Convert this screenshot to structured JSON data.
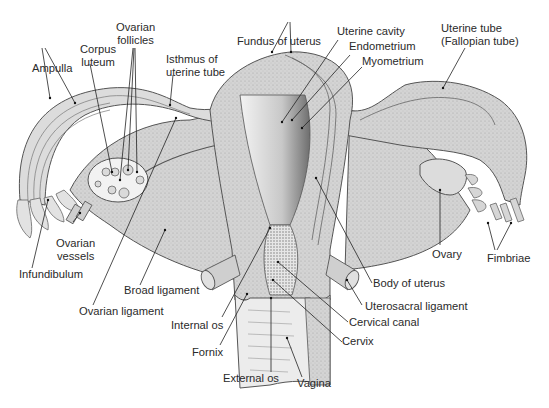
{
  "diagram": {
    "colors": {
      "background": "#ffffff",
      "tissue": "#d2d2d2",
      "tissue_dark": "#a8a8a8",
      "cavity": "#efefef",
      "outline": "#555555",
      "leader": "#222222",
      "text": "#2a2a2a"
    },
    "labels": {
      "ovarian_follicles_1": "Ovarian",
      "ovarian_follicles_2": "follicles",
      "corpus_luteum_1": "Corpus",
      "corpus_luteum_2": "luteum",
      "ampulla": "Ampulla",
      "isthmus_1": "Isthmus of",
      "isthmus_2": "uterine tube",
      "fundus": "Fundus of uterus",
      "uterine_cavity": "Uterine cavity",
      "endometrium": "Endometrium",
      "myometrium": "Myometrium",
      "uterine_tube_1": "Uterine tube",
      "uterine_tube_2": "(Fallopian tube)",
      "ovarian_vessels_1": "Ovarian",
      "ovarian_vessels_2": "vessels",
      "infundibulum": "Infundibulum",
      "broad_ligament": "Broad ligament",
      "ovarian_ligament": "Ovarian ligament",
      "internal_os": "Internal os",
      "fornix": "Fornix",
      "external_os": "External os",
      "vagina": "Vagina",
      "cervix": "Cervix",
      "cervical_canal": "Cervical canal",
      "uterosacral_ligament": "Uterosacral ligament",
      "body_of_uterus": "Body of uterus",
      "ovary": "Ovary",
      "fimbriae": "Fimbriae"
    }
  }
}
